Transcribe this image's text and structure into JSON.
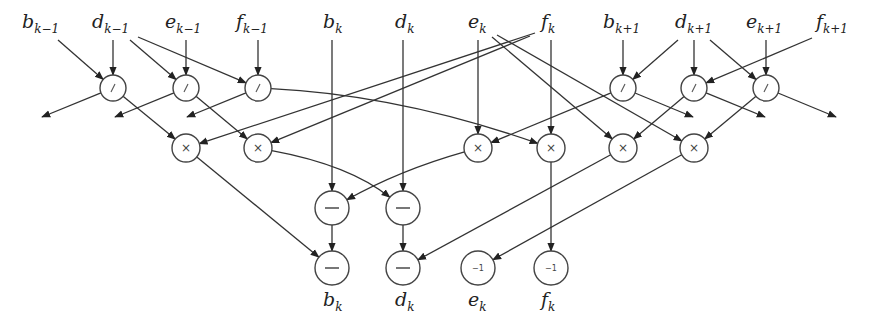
{
  "diagram": {
    "type": "dataflow-graph",
    "top_labels": [
      {
        "base": "b",
        "sub": "k−1",
        "x": 22
      },
      {
        "base": "d",
        "sub": "k−1",
        "x": 92
      },
      {
        "base": "e",
        "sub": "k−1",
        "x": 165
      },
      {
        "base": "f",
        "sub": "k−1",
        "x": 236
      },
      {
        "base": "b",
        "sub": "k",
        "x": 323
      },
      {
        "base": "d",
        "sub": "k",
        "x": 395
      },
      {
        "base": "e",
        "sub": "k",
        "x": 468
      },
      {
        "base": "f",
        "sub": "k",
        "x": 541
      },
      {
        "base": "b",
        "sub": "k+1",
        "x": 603
      },
      {
        "base": "d",
        "sub": "k+1",
        "x": 675
      },
      {
        "base": "e",
        "sub": "k+1",
        "x": 746
      },
      {
        "base": "f",
        "sub": "k+1",
        "x": 816
      }
    ],
    "bottom_labels": [
      {
        "base": "b",
        "sub": "k",
        "x": 323
      },
      {
        "base": "d",
        "sub": "k",
        "x": 395
      },
      {
        "base": "e",
        "sub": "k",
        "x": 468
      },
      {
        "base": "f",
        "sub": "k",
        "x": 541
      }
    ],
    "operators": {
      "divide": "/",
      "multiply": "×",
      "subtract": "−",
      "reciprocal": "−1"
    },
    "nodes": [
      {
        "id": "div1",
        "op": "/",
        "x": 113,
        "y": 88,
        "r": 13
      },
      {
        "id": "div2",
        "op": "/",
        "x": 186,
        "y": 88,
        "r": 13
      },
      {
        "id": "div3",
        "op": "/",
        "x": 258,
        "y": 88,
        "r": 13
      },
      {
        "id": "div4",
        "op": "/",
        "x": 623,
        "y": 88,
        "r": 13
      },
      {
        "id": "div5",
        "op": "/",
        "x": 694,
        "y": 88,
        "r": 13
      },
      {
        "id": "div6",
        "op": "/",
        "x": 766,
        "y": 88,
        "r": 13
      },
      {
        "id": "mul1",
        "op": "×",
        "x": 186,
        "y": 148,
        "r": 14
      },
      {
        "id": "mul2",
        "op": "×",
        "x": 258,
        "y": 148,
        "r": 14
      },
      {
        "id": "mul3",
        "op": "×",
        "x": 478,
        "y": 148,
        "r": 14
      },
      {
        "id": "mul4",
        "op": "×",
        "x": 551,
        "y": 148,
        "r": 14
      },
      {
        "id": "mul5",
        "op": "×",
        "x": 623,
        "y": 148,
        "r": 14
      },
      {
        "id": "mul6",
        "op": "×",
        "x": 694,
        "y": 148,
        "r": 14
      },
      {
        "id": "sub1",
        "op": "−",
        "x": 332,
        "y": 208,
        "r": 17
      },
      {
        "id": "sub2",
        "op": "−",
        "x": 403,
        "y": 208,
        "r": 17
      },
      {
        "id": "sub3",
        "op": "−",
        "x": 332,
        "y": 268,
        "r": 17
      },
      {
        "id": "sub4",
        "op": "−",
        "x": 403,
        "y": 268,
        "r": 17
      },
      {
        "id": "inv1",
        "op": "−1",
        "x": 478,
        "y": 268,
        "r": 17
      },
      {
        "id": "inv2",
        "op": "−1",
        "x": 551,
        "y": 268,
        "r": 17
      }
    ]
  }
}
